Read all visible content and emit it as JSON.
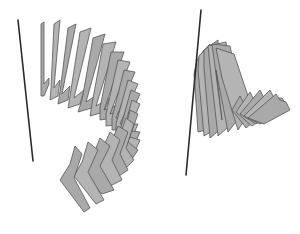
{
  "figure": {
    "width": 300,
    "height": 234,
    "background": "#ffffff",
    "plate_fill": "#a9a9a9",
    "plate_stroke": "#555555",
    "axis_color": "#2a2a2a"
  },
  "panels": [
    {
      "name": "left-helix",
      "axis": {
        "x1": 18,
        "y1": 20,
        "x2": 33,
        "y2": 161
      },
      "plates": [
        [
          [
            41,
            24
          ],
          [
            44,
            22
          ],
          [
            44,
            84
          ],
          [
            49,
            78
          ],
          [
            49,
            84
          ],
          [
            44,
            96
          ],
          [
            41,
            96
          ]
        ],
        [
          [
            54,
            24
          ],
          [
            60,
            20
          ],
          [
            54,
            88
          ],
          [
            60,
            80
          ],
          [
            58,
            96
          ],
          [
            50,
            100
          ],
          [
            51,
            88
          ]
        ],
        [
          [
            68,
            28
          ],
          [
            76,
            24
          ],
          [
            62,
            94
          ],
          [
            70,
            86
          ],
          [
            68,
            100
          ],
          [
            58,
            104
          ],
          [
            60,
            92
          ]
        ],
        [
          [
            80,
            32
          ],
          [
            91,
            28
          ],
          [
            74,
            98
          ],
          [
            84,
            90
          ],
          [
            80,
            104
          ],
          [
            68,
            108
          ],
          [
            70,
            96
          ]
        ],
        [
          [
            93,
            38
          ],
          [
            105,
            34
          ],
          [
            86,
            102
          ],
          [
            98,
            94
          ],
          [
            92,
            108
          ],
          [
            78,
            112
          ],
          [
            82,
            100
          ]
        ],
        [
          [
            103,
            44
          ],
          [
            116,
            42
          ],
          [
            96,
            106
          ],
          [
            110,
            98
          ],
          [
            104,
            112
          ],
          [
            90,
            116
          ],
          [
            92,
            104
          ]
        ],
        [
          [
            111,
            52
          ],
          [
            124,
            52
          ],
          [
            104,
            110
          ],
          [
            120,
            104
          ],
          [
            114,
            118
          ],
          [
            100,
            120
          ],
          [
            100,
            108
          ]
        ],
        [
          [
            118,
            60
          ],
          [
            130,
            62
          ],
          [
            110,
            114
          ],
          [
            128,
            110
          ],
          [
            122,
            124
          ],
          [
            106,
            126
          ],
          [
            106,
            114
          ]
        ],
        [
          [
            124,
            70
          ],
          [
            135,
            72
          ],
          [
            116,
            118
          ],
          [
            134,
            116
          ],
          [
            128,
            130
          ],
          [
            112,
            130
          ],
          [
            112,
            118
          ]
        ],
        [
          [
            128,
            80
          ],
          [
            138,
            84
          ],
          [
            120,
            124
          ],
          [
            138,
            124
          ],
          [
            132,
            138
          ],
          [
            116,
            136
          ],
          [
            116,
            124
          ]
        ],
        [
          [
            131,
            90
          ],
          [
            140,
            94
          ],
          [
            124,
            130
          ],
          [
            140,
            132
          ],
          [
            134,
            146
          ],
          [
            118,
            142
          ],
          [
            120,
            130
          ]
        ],
        [
          [
            132,
            100
          ],
          [
            140,
            104
          ],
          [
            126,
            136
          ],
          [
            140,
            140
          ],
          [
            134,
            154
          ],
          [
            118,
            150
          ],
          [
            122,
            136
          ]
        ],
        [
          [
            130,
            110
          ],
          [
            138,
            114
          ],
          [
            128,
            142
          ],
          [
            138,
            150
          ],
          [
            130,
            162
          ],
          [
            112,
            156
          ],
          [
            122,
            142
          ]
        ],
        [
          [
            126,
            118
          ],
          [
            134,
            124
          ],
          [
            126,
            148
          ],
          [
            134,
            160
          ],
          [
            124,
            170
          ],
          [
            104,
            160
          ],
          [
            116,
            146
          ]
        ],
        [
          [
            118,
            126
          ],
          [
            128,
            132
          ],
          [
            120,
            154
          ],
          [
            128,
            170
          ],
          [
            116,
            178
          ],
          [
            96,
            164
          ],
          [
            108,
            150
          ]
        ],
        [
          [
            110,
            132
          ],
          [
            120,
            140
          ],
          [
            112,
            160
          ],
          [
            122,
            180
          ],
          [
            110,
            186
          ],
          [
            90,
            168
          ],
          [
            100,
            154
          ]
        ],
        [
          [
            100,
            138
          ],
          [
            110,
            146
          ],
          [
            100,
            166
          ],
          [
            114,
            190
          ],
          [
            102,
            194
          ],
          [
            82,
            172
          ],
          [
            92,
            158
          ]
        ],
        [
          [
            88,
            142
          ],
          [
            98,
            150
          ],
          [
            88,
            172
          ],
          [
            104,
            200
          ],
          [
            96,
            204
          ],
          [
            74,
            176
          ],
          [
            82,
            162
          ]
        ],
        [
          [
            75,
            146
          ],
          [
            82,
            154
          ],
          [
            74,
            178
          ],
          [
            90,
            208
          ],
          [
            84,
            212
          ],
          [
            60,
            180
          ],
          [
            70,
            164
          ]
        ]
      ]
    },
    {
      "name": "right-helix",
      "axis": {
        "x1": 201,
        "y1": 10,
        "x2": 186,
        "y2": 175
      },
      "plates": [
        [
          [
            197,
            60
          ],
          [
            204,
            50
          ],
          [
            206,
            130
          ],
          [
            198,
            132
          ],
          [
            194,
            74
          ]
        ],
        [
          [
            199,
            56
          ],
          [
            210,
            44
          ],
          [
            214,
            130
          ],
          [
            204,
            136
          ],
          [
            198,
            70
          ]
        ],
        [
          [
            204,
            50
          ],
          [
            218,
            40
          ],
          [
            222,
            128
          ],
          [
            210,
            138
          ],
          [
            204,
            68
          ]
        ],
        [
          [
            208,
            46
          ],
          [
            226,
            42
          ],
          [
            236,
            120
          ],
          [
            218,
            136
          ],
          [
            210,
            66
          ]
        ],
        [
          [
            212,
            44
          ],
          [
            230,
            46
          ],
          [
            244,
            112
          ],
          [
            228,
            132
          ],
          [
            216,
            70
          ],
          [
            222,
            120
          ]
        ],
        [
          [
            216,
            48
          ],
          [
            234,
            54
          ],
          [
            252,
            108
          ],
          [
            238,
            130
          ],
          [
            222,
            78
          ]
        ],
        [
          [
            232,
            110
          ],
          [
            240,
            96
          ],
          [
            244,
            104
          ],
          [
            260,
            100
          ],
          [
            268,
            110
          ],
          [
            246,
            128
          ]
        ],
        [
          [
            236,
            112
          ],
          [
            250,
            92
          ],
          [
            254,
            100
          ],
          [
            268,
            96
          ],
          [
            276,
            108
          ],
          [
            252,
            126
          ]
        ],
        [
          [
            240,
            114
          ],
          [
            260,
            90
          ],
          [
            264,
            98
          ],
          [
            276,
            96
          ],
          [
            282,
            108
          ],
          [
            256,
            124
          ]
        ],
        [
          [
            244,
            116
          ],
          [
            270,
            90
          ],
          [
            274,
            98
          ],
          [
            282,
            98
          ],
          [
            288,
            108
          ],
          [
            260,
            124
          ]
        ],
        [
          [
            248,
            118
          ],
          [
            276,
            94
          ],
          [
            280,
            100
          ],
          [
            286,
            102
          ],
          [
            290,
            110
          ],
          [
            264,
            124
          ]
        ]
      ]
    }
  ]
}
